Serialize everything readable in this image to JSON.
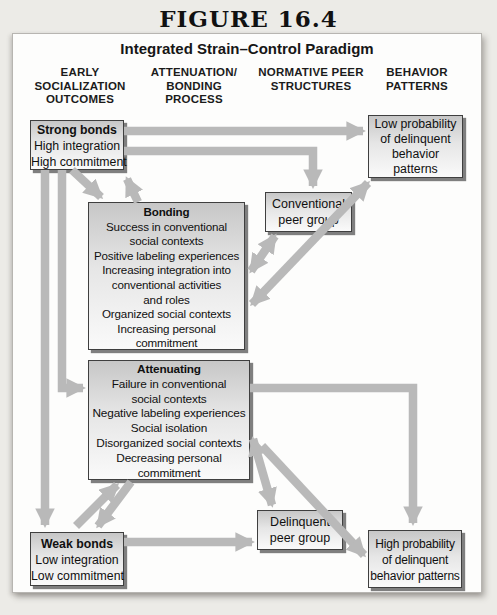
{
  "figure": {
    "label": "FIGURE 16.4",
    "title": "Integrated Strain–Control Paradigm"
  },
  "columns": [
    {
      "id": "early-socialization-outcomes",
      "lines": [
        "EARLY",
        "SOCIALIZATION",
        "OUTCOMES"
      ]
    },
    {
      "id": "attenuation-bonding-process",
      "lines": [
        "ATTENUATION/",
        "BONDING",
        "PROCESS"
      ]
    },
    {
      "id": "normative-peer-structures",
      "lines": [
        "NORMATIVE PEER",
        "STRUCTURES"
      ]
    },
    {
      "id": "behavior-patterns",
      "lines": [
        "BEHAVIOR",
        "PATTERNS"
      ]
    }
  ],
  "boxes": {
    "strong_bonds": {
      "title": "Strong bonds",
      "lines": [
        "High integration",
        "High commitment"
      ]
    },
    "low_probability": {
      "lines": [
        "Low probability",
        "of delinquent",
        "behavior",
        "patterns"
      ]
    },
    "bonding": {
      "title": "Bonding",
      "lines": [
        "Success in conventional",
        "social contexts",
        "Positive labeling experiences",
        "Increasing integration into",
        "conventional activities",
        "and roles",
        "Organized social contexts",
        "Increasing personal",
        "commitment"
      ]
    },
    "conventional_peer": {
      "lines": [
        "Conventional",
        "peer group"
      ]
    },
    "attenuating": {
      "title": "Attenuating",
      "lines": [
        "Failure in conventional",
        "social contexts",
        "Negative labeling experiences",
        "Social isolation",
        "Disorganized social contexts",
        "Decreasing personal",
        "commitment"
      ]
    },
    "weak_bonds": {
      "title": "Weak bonds",
      "lines": [
        "Low integration",
        "Low commitment"
      ]
    },
    "delinquent_peer": {
      "lines": [
        "Delinquent",
        "peer group"
      ]
    },
    "high_probability": {
      "lines": [
        "High probability",
        "of delinquent",
        "behavior patterns"
      ]
    }
  },
  "connections": [
    {
      "from": "strong_bonds",
      "to": "low_probability",
      "arrow": "single"
    },
    {
      "from": "strong_bonds",
      "to": "conventional_peer",
      "arrow": "single-elbow"
    },
    {
      "from": "strong_bonds",
      "to": "bonding",
      "arrow": "bidirectional-pair"
    },
    {
      "from": "strong_bonds",
      "to": "weak_bonds",
      "arrow": "single"
    },
    {
      "from": "strong_bonds",
      "to": "attenuating",
      "arrow": "single-elbow"
    },
    {
      "from": "bonding",
      "to": "conventional_peer",
      "arrow": "double-headed"
    },
    {
      "from": "bonding",
      "to": "low_probability",
      "arrow": "double-headed"
    },
    {
      "from": "attenuating",
      "to": "high_probability",
      "arrow": "single-elbow"
    },
    {
      "from": "attenuating",
      "to": "delinquent_peer",
      "arrow": "double-headed"
    },
    {
      "from": "attenuating",
      "to": "high_probability",
      "arrow": "single-diagonal"
    },
    {
      "from": "attenuating",
      "to": "weak_bonds",
      "arrow": "bidirectional-pair"
    },
    {
      "from": "weak_bonds",
      "to": "delinquent_peer",
      "arrow": "single"
    }
  ],
  "colors": {
    "arrow_gray": "#b9b9b9",
    "box_border": "#3f3f3f",
    "box_gradient_top": "#c7c7c7",
    "box_gradient_bottom": "#fafafa",
    "panel_background": "#fdfdfc",
    "page_background": "#ecebe7",
    "text": "#141414"
  }
}
